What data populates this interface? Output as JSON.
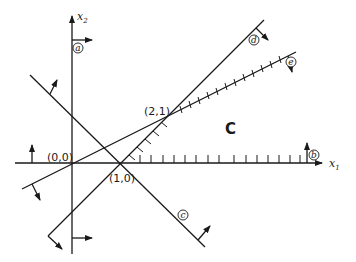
{
  "diagram": {
    "type": "linear-programming-feasible-region",
    "axes": {
      "x_axis_label": "x",
      "x_axis_subscript": "1",
      "y_axis_label": "x",
      "y_axis_subscript": "2"
    },
    "points": [
      {
        "id": "origin",
        "label": "(0,0)"
      },
      {
        "id": "p10",
        "label": "(1,0)"
      },
      {
        "id": "p21",
        "label": "(2,1)"
      }
    ],
    "constraint_lines": [
      {
        "id": "a",
        "label": "a"
      },
      {
        "id": "b",
        "label": "b"
      },
      {
        "id": "c",
        "label": "c"
      },
      {
        "id": "d",
        "label": "d"
      },
      {
        "id": "e",
        "label": "e"
      }
    ],
    "region_label": "C"
  }
}
